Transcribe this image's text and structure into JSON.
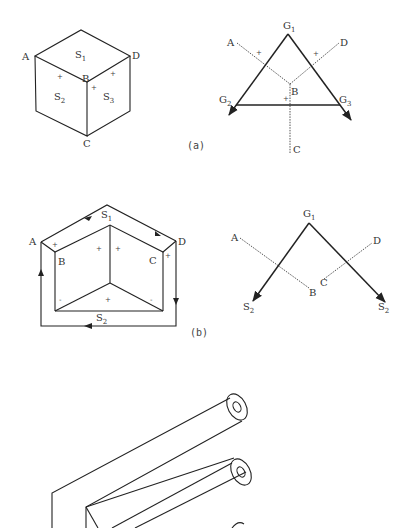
{
  "figure_a": {
    "caption": "(a)",
    "cube": {
      "vertices": {
        "A": "A",
        "B": "B",
        "C": "C",
        "D": "D"
      },
      "faces": [
        {
          "label": "S",
          "sub": "1"
        },
        {
          "label": "S",
          "sub": "2"
        },
        {
          "label": "S",
          "sub": "3"
        }
      ],
      "signs": [
        "+",
        "+",
        "+"
      ]
    },
    "graph": {
      "nodes": [
        {
          "label": "G",
          "sub": "1"
        },
        {
          "label": "G",
          "sub": "2"
        },
        {
          "label": "G",
          "sub": "3"
        }
      ],
      "edge_labels": {
        "A": "A",
        "B": "B",
        "C": "C",
        "D": "D"
      },
      "signs": [
        "+",
        "+",
        "+"
      ]
    }
  },
  "figure_b": {
    "caption": "(b)",
    "prism": {
      "vertices": {
        "A": "A",
        "B": "B",
        "C": "C",
        "D": "D"
      },
      "faces": [
        {
          "label": "S",
          "sub": "1"
        },
        {
          "label": "S",
          "sub": "2"
        }
      ],
      "signs": [
        "+",
        "+",
        "+",
        "+",
        "-",
        "+",
        "-"
      ]
    },
    "graph": {
      "nodes": [
        {
          "label": "G",
          "sub": "1"
        },
        {
          "label": "S",
          "sub": "2"
        },
        {
          "label": "S",
          "sub": "2"
        }
      ],
      "edge_labels": {
        "A": "A",
        "B": "B",
        "C": "C",
        "D": "D"
      }
    }
  },
  "figure_c": {
    "description": "isometric drawing of three hollow cylindrical tubes on a folded plate"
  }
}
